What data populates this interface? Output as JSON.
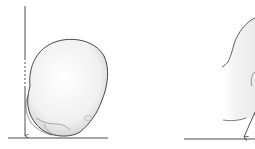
{
  "figure": {
    "panels": [
      {
        "id": "left",
        "subject": "skull-profile-tilted",
        "elements": [
          "vertical-reference-line",
          "baseline",
          "arrow-down",
          "skull-outline"
        ]
      },
      {
        "id": "right",
        "subject": "skull-profile-partial",
        "elements": [
          "baseline",
          "arrow-diagonal",
          "skull-outline-partial"
        ]
      }
    ],
    "colors": {
      "line": "#222222",
      "skull_fill": "#f2f2f2",
      "skull_shade": "#d8d8d8",
      "background": "#ffffff"
    }
  }
}
